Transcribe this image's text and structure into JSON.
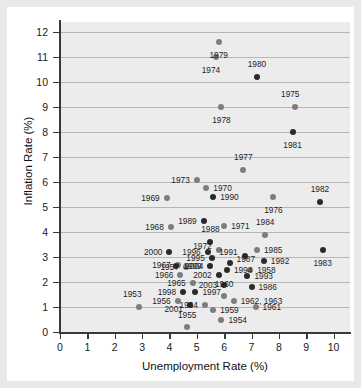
{
  "chart_data": {
    "type": "scatter",
    "title": "",
    "xlabel": "Unemployment Rate (%)",
    "ylabel": "Inflation Rate (%)",
    "xlim": [
      0,
      10.6
    ],
    "ylim": [
      0,
      12.4
    ],
    "xticks": [
      0,
      1,
      2,
      3,
      4,
      5,
      6,
      7,
      8,
      9,
      10
    ],
    "yticks": [
      0,
      1,
      2,
      3,
      4,
      5,
      6,
      7,
      8,
      9,
      10,
      11,
      12
    ],
    "grid": "horizontal",
    "legend": "none",
    "point_color": "#7d7d7d",
    "highlight_color": "#2a2a2a",
    "plot_background": "#ececed",
    "points": [
      {
        "label": "1953",
        "x": 2.9,
        "y": 1.0,
        "lx": -7,
        "ly": -9,
        "pos": "above",
        "dark": false
      },
      {
        "label": "1954",
        "x": 5.9,
        "y": 0.5,
        "lx": 7,
        "ly": 0,
        "pos": "right",
        "dark": false
      },
      {
        "label": "1955",
        "x": 4.65,
        "y": 0.2,
        "lx": 0,
        "ly": -8,
        "pos": "above",
        "dark": false
      },
      {
        "label": "1956",
        "x": 4.3,
        "y": 1.25,
        "lx": -7,
        "ly": 0,
        "pos": "left",
        "dark": false
      },
      {
        "label": "1957",
        "x": 4.6,
        "y": 2.6,
        "lx": -7,
        "ly": 0,
        "pos": "left",
        "dark": false
      },
      {
        "label": "1958",
        "x": 6.95,
        "y": 2.5,
        "lx": 7,
        "ly": 0,
        "pos": "right",
        "dark": false
      },
      {
        "label": "1959",
        "x": 5.6,
        "y": 0.9,
        "lx": 7,
        "ly": 0,
        "pos": "right",
        "dark": false
      },
      {
        "label": "1960",
        "x": 6.0,
        "y": 1.45,
        "lx": 0,
        "ly": -8,
        "pos": "above",
        "dark": false
      },
      {
        "label": "1961",
        "x": 7.15,
        "y": 1.0,
        "lx": 7,
        "ly": 0,
        "pos": "right",
        "dark": false
      },
      {
        "label": "1962, 1963",
        "x": 6.35,
        "y": 1.25,
        "lx": 7,
        "ly": 0,
        "pos": "right",
        "dark": false
      },
      {
        "label": "1964",
        "x": 5.3,
        "y": 1.1,
        "lx": -7,
        "ly": 0,
        "pos": "left",
        "dark": false
      },
      {
        "label": "1965",
        "x": 4.85,
        "y": 1.95,
        "lx": -7,
        "ly": 0,
        "pos": "left",
        "dark": false
      },
      {
        "label": "1966",
        "x": 4.4,
        "y": 2.3,
        "lx": -7,
        "ly": 0,
        "pos": "left",
        "dark": false
      },
      {
        "label": "1967",
        "x": 4.3,
        "y": 2.7,
        "lx": -7,
        "ly": 0,
        "pos": "left",
        "dark": false
      },
      {
        "label": "1968",
        "x": 4.05,
        "y": 4.2,
        "lx": -7,
        "ly": 0,
        "pos": "left",
        "dark": false
      },
      {
        "label": "1969",
        "x": 3.9,
        "y": 5.35,
        "lx": -7,
        "ly": 0,
        "pos": "left",
        "dark": false
      },
      {
        "label": "1970",
        "x": 5.35,
        "y": 5.75,
        "lx": 7,
        "ly": 0,
        "pos": "right",
        "dark": false
      },
      {
        "label": "1971",
        "x": 6.0,
        "y": 4.25,
        "lx": 7,
        "ly": 0,
        "pos": "right",
        "dark": false
      },
      {
        "label": "1972",
        "x": 5.8,
        "y": 3.3,
        "lx": -7,
        "ly": -4,
        "pos": "left",
        "dark": false
      },
      {
        "label": "1973",
        "x": 5.0,
        "y": 6.1,
        "lx": -7,
        "ly": 0,
        "pos": "left",
        "dark": false
      },
      {
        "label": "1974",
        "x": 5.7,
        "y": 11.0,
        "lx": -5,
        "ly": 9,
        "pos": "below",
        "dark": false
      },
      {
        "label": "1975",
        "x": 8.6,
        "y": 9.0,
        "lx": -5,
        "ly": -9,
        "pos": "above",
        "dark": false
      },
      {
        "label": "1976",
        "x": 7.8,
        "y": 5.4,
        "lx": 0,
        "ly": 9,
        "pos": "below",
        "dark": false
      },
      {
        "label": "1977",
        "x": 6.7,
        "y": 6.5,
        "lx": 0,
        "ly": -9,
        "pos": "above",
        "dark": false
      },
      {
        "label": "1978",
        "x": 5.9,
        "y": 9.0,
        "lx": 0,
        "ly": 9,
        "pos": "below",
        "dark": false
      },
      {
        "label": "1979",
        "x": 5.8,
        "y": 11.6,
        "lx": 0,
        "ly": 9,
        "pos": "below",
        "dark": false
      },
      {
        "label": "1980",
        "x": 7.2,
        "y": 10.2,
        "lx": 0,
        "ly": -9,
        "pos": "above",
        "dark": true
      },
      {
        "label": "1981",
        "x": 8.5,
        "y": 8.0,
        "lx": 0,
        "ly": 9,
        "pos": "below",
        "dark": true
      },
      {
        "label": "1982",
        "x": 9.5,
        "y": 5.2,
        "lx": 0,
        "ly": -9,
        "pos": "above",
        "dark": true
      },
      {
        "label": "1983",
        "x": 9.6,
        "y": 3.3,
        "lx": 0,
        "ly": 9,
        "pos": "below",
        "dark": true
      },
      {
        "label": "1984",
        "x": 7.5,
        "y": 3.9,
        "lx": 0,
        "ly": -9,
        "pos": "above",
        "dark": false
      },
      {
        "label": "1985",
        "x": 7.2,
        "y": 3.3,
        "lx": 7,
        "ly": 0,
        "pos": "right",
        "dark": false
      },
      {
        "label": "1986",
        "x": 7.0,
        "y": 1.8,
        "lx": 7,
        "ly": 0,
        "pos": "right",
        "dark": true
      },
      {
        "label": "1987",
        "x": 6.2,
        "y": 2.75,
        "lx": 7,
        "ly": -4,
        "pos": "right",
        "dark": true
      },
      {
        "label": "1988",
        "x": 5.5,
        "y": 3.6,
        "lx": 0,
        "ly": -9,
        "pos": "above",
        "dark": true
      },
      {
        "label": "1989",
        "x": 5.25,
        "y": 4.45,
        "lx": -7,
        "ly": 0,
        "pos": "left",
        "dark": true
      },
      {
        "label": "1990",
        "x": 5.6,
        "y": 5.4,
        "lx": 7,
        "ly": 0,
        "pos": "right",
        "dark": true
      },
      {
        "label": "1991",
        "x": 6.75,
        "y": 3.05,
        "lx": -7,
        "ly": -4,
        "pos": "left",
        "dark": true
      },
      {
        "label": "1992",
        "x": 7.45,
        "y": 2.85,
        "lx": 7,
        "ly": 0,
        "pos": "right",
        "dark": true
      },
      {
        "label": "1993",
        "x": 6.85,
        "y": 2.25,
        "lx": 7,
        "ly": 0,
        "pos": "right",
        "dark": true
      },
      {
        "label": "1994",
        "x": 6.1,
        "y": 2.5,
        "lx": 7,
        "ly": 0,
        "pos": "right",
        "dark": true
      },
      {
        "label": "1995",
        "x": 5.55,
        "y": 2.95,
        "lx": -7,
        "ly": 0,
        "pos": "left",
        "dark": true
      },
      {
        "label": "1996",
        "x": 5.4,
        "y": 3.2,
        "lx": -7,
        "ly": 0,
        "pos": "left",
        "dark": true
      },
      {
        "label": "1997",
        "x": 4.95,
        "y": 1.6,
        "lx": 7,
        "ly": 0,
        "pos": "right",
        "dark": true
      },
      {
        "label": "1998",
        "x": 4.5,
        "y": 1.6,
        "lx": -7,
        "ly": 0,
        "pos": "left",
        "dark": true
      },
      {
        "label": "1999",
        "x": 4.25,
        "y": 2.65,
        "lx": 7,
        "ly": 0,
        "pos": "right",
        "dark": true
      },
      {
        "label": "2000",
        "x": 4.0,
        "y": 3.2,
        "lx": -7,
        "ly": 0,
        "pos": "left",
        "dark": true
      },
      {
        "label": "2001",
        "x": 4.75,
        "y": 1.1,
        "lx": -7,
        "ly": 4,
        "pos": "left",
        "dark": true
      },
      {
        "label": "2002",
        "x": 5.8,
        "y": 2.3,
        "lx": -7,
        "ly": 0,
        "pos": "left",
        "dark": true
      },
      {
        "label": "2003",
        "x": 6.0,
        "y": 1.9,
        "lx": -7,
        "ly": 0,
        "pos": "left",
        "dark": true
      },
      {
        "label": "2004",
        "x": 5.5,
        "y": 2.65,
        "lx": -7,
        "ly": 0,
        "pos": "left",
        "dark": true
      }
    ]
  },
  "axes": {
    "xlabel": "Unemployment Rate (%)",
    "ylabel": "Inflation Rate (%)",
    "xticks": [
      "0",
      "1",
      "2",
      "3",
      "4",
      "5",
      "6",
      "7",
      "8",
      "9",
      "10"
    ],
    "yticks": [
      "0",
      "1",
      "2",
      "3",
      "4",
      "5",
      "6",
      "7",
      "8",
      "9",
      "10",
      "11",
      "12"
    ]
  }
}
